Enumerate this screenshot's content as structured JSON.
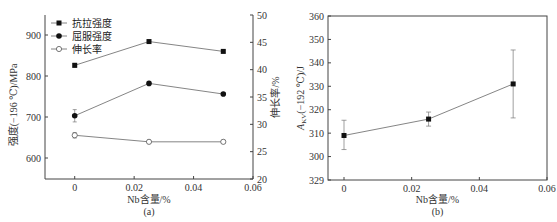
{
  "chart_data": [
    {
      "id": "a",
      "type": "line",
      "panel_label": "(a)",
      "xlabel": "Nb含量/%",
      "ylabel_left": "强度(−196 ℃)/MPa",
      "ylabel_right": "伸长率/%",
      "x": [
        0,
        0.025,
        0.05
      ],
      "xlim": [
        -0.01,
        0.06
      ],
      "xticks": [
        "0",
        "0.02",
        "0.04",
        "0.06"
      ],
      "ylim_left": [
        550,
        950
      ],
      "yticks_left": [
        "600",
        "700",
        "800",
        "900"
      ],
      "ylim_right": [
        20,
        50
      ],
      "yticks_right": [
        "20",
        "25",
        "30",
        "35",
        "40",
        "45",
        "50"
      ],
      "legend_position": "upper left",
      "series": [
        {
          "name": "抗拉强度",
          "axis": "left",
          "marker": "filled-square",
          "values": [
            826,
            884,
            860
          ],
          "errors": [
            5,
            3,
            3
          ]
        },
        {
          "name": "屈服强度",
          "axis": "left",
          "marker": "filled-circle",
          "values": [
            703,
            782,
            756
          ],
          "errors": [
            15,
            3,
            3
          ]
        },
        {
          "name": "伸长率",
          "axis": "right",
          "marker": "open-circle",
          "values": [
            28.0,
            26.8,
            26.8
          ],
          "errors": [
            0.5,
            0.3,
            0.3
          ]
        }
      ]
    },
    {
      "id": "b",
      "type": "line",
      "panel_label": "(b)",
      "xlabel": "Nb含量/%",
      "ylabel": "A_KV(−192 ℃)/J",
      "ylabel_main": "A",
      "ylabel_sub": "KV",
      "ylabel_rest": "(−192 ℃)/J",
      "x": [
        0,
        0.025,
        0.05
      ],
      "xlim": [
        -0.01,
        0.06
      ],
      "xticks": [
        "0",
        "0.02",
        "0.04",
        "0.06"
      ],
      "ylim": [
        290,
        360
      ],
      "yticks": [
        "329",
        "300",
        "310",
        "320",
        "330",
        "340",
        "350",
        "360"
      ],
      "series": [
        {
          "name": "A_KV",
          "marker": "filled-square",
          "values": [
            309,
            316,
            331
          ],
          "err_low": [
            303,
            313,
            316.5
          ],
          "err_high": [
            315.5,
            319,
            345.5
          ]
        }
      ]
    }
  ]
}
